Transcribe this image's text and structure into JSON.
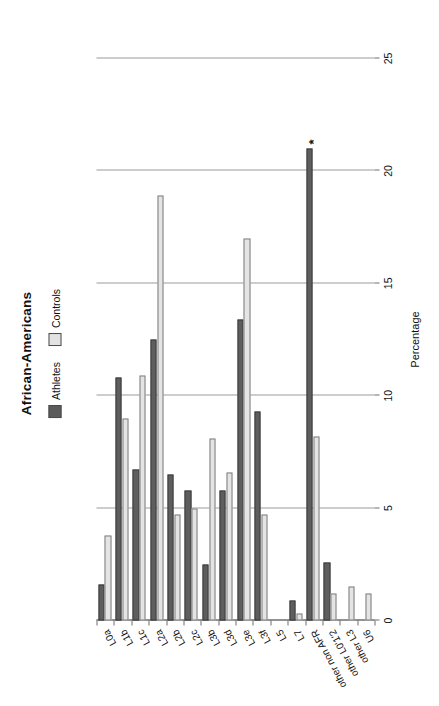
{
  "chart_data": {
    "type": "bar",
    "orientation": "horizontal",
    "title": "African-Americans",
    "xlabel": "",
    "ylabel": "Percentage",
    "value_axis_title": "Percentage",
    "ylim": [
      0,
      25
    ],
    "ticks": [
      0,
      5,
      10,
      15,
      20,
      25
    ],
    "tick_labels": [
      "0",
      "5",
      "10",
      "15",
      "20",
      "25"
    ],
    "grid": true,
    "legend_position": "top",
    "categories": [
      "L0a",
      "L1b",
      "L1c",
      "L2a",
      "L2b",
      "L2c",
      "L3b",
      "L3d",
      "L3e",
      "L3f",
      "L5",
      "L7",
      "other non AFR",
      "other L0'1'2",
      "other L3",
      "U6"
    ],
    "series": [
      {
        "name": "Athletes",
        "color": "#5e5e5e",
        "values": [
          1.6,
          10.8,
          6.7,
          12.5,
          6.5,
          5.8,
          2.5,
          5.8,
          13.4,
          9.3,
          0,
          0.9,
          21.0,
          2.6,
          0,
          0
        ]
      },
      {
        "name": "Controls",
        "color": "#e4e4e4",
        "values": [
          3.8,
          9.0,
          10.9,
          18.9,
          4.7,
          5.0,
          8.1,
          6.6,
          17.0,
          4.7,
          0,
          0.3,
          8.2,
          1.2,
          1.5,
          1.2
        ]
      }
    ],
    "annotations": [
      {
        "category": "other non AFR",
        "series": "Athletes",
        "text": "*"
      }
    ]
  },
  "legend": {
    "items": [
      {
        "label": "Athletes",
        "swatch": "athletes-swatch"
      },
      {
        "label": "Controls",
        "swatch": "controls-swatch"
      }
    ]
  }
}
